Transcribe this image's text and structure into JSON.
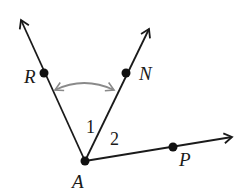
{
  "diagram": {
    "type": "geometry-angles",
    "vertex": {
      "name": "A",
      "x": 85,
      "y": 161
    },
    "rays": [
      {
        "id": "AR",
        "through": "R",
        "tip": [
          20,
          18
        ]
      },
      {
        "id": "AN",
        "through": "N",
        "tip": [
          150,
          27
        ]
      },
      {
        "id": "AP",
        "through": "P",
        "tip": [
          234,
          137
        ]
      }
    ],
    "points": [
      {
        "name": "A",
        "x": 85,
        "y": 161
      },
      {
        "name": "R",
        "x": 44,
        "y": 73
      },
      {
        "name": "N",
        "x": 126,
        "y": 73
      },
      {
        "name": "P",
        "x": 173,
        "y": 147
      }
    ],
    "labels": {
      "A": "A",
      "R": "R",
      "N": "N",
      "P": "P",
      "angle1": "1",
      "angle2": "2"
    },
    "annotations": [
      {
        "type": "curved-double-arrow",
        "between": [
          "AR",
          "AN"
        ],
        "color": "#8a8a8a"
      }
    ],
    "colors": {
      "line": "#1a1a1a",
      "arc": "#8a8a8a"
    }
  }
}
